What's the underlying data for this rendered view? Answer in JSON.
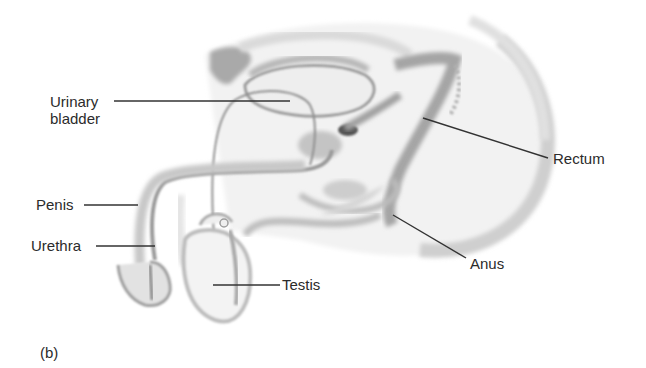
{
  "figure": {
    "panel_label": "(b)",
    "colors": {
      "background": "#ffffff",
      "tissue_light": "#ececec",
      "tissue_mid": "#c9c9c9",
      "tissue_dark": "#9a9a9a",
      "outline": "#8a8a8a",
      "leader_line": "#333333",
      "text": "#2b2b2b"
    },
    "labels": [
      {
        "id": "urinary-bladder",
        "line1": "Urinary",
        "line2": "bladder"
      },
      {
        "id": "penis",
        "text": "Penis"
      },
      {
        "id": "urethra",
        "text": "Urethra"
      },
      {
        "id": "testis",
        "text": "Testis"
      },
      {
        "id": "rectum",
        "text": "Rectum"
      },
      {
        "id": "anus",
        "text": "Anus"
      }
    ]
  }
}
